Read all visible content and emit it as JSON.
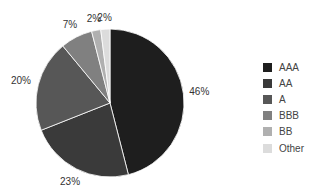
{
  "chart_data": {
    "type": "pie",
    "title": "",
    "categories": [
      "AAA",
      "AA",
      "A",
      "BBB",
      "BB",
      "Other"
    ],
    "values": [
      46,
      23,
      20,
      7,
      2,
      2
    ],
    "labels": [
      "46%",
      "23%",
      "20%",
      "7%",
      "2%",
      "2%"
    ],
    "colors": [
      "#1e1e1e",
      "#3a3a3a",
      "#575757",
      "#808080",
      "#b0b0b0",
      "#dcdcdc"
    ],
    "start_angle": "12 o'clock",
    "direction": "clockwise",
    "legend_position": "right"
  },
  "legend": {
    "items": [
      {
        "label": "AAA",
        "color": "#1e1e1e"
      },
      {
        "label": "AA",
        "color": "#3a3a3a"
      },
      {
        "label": "A",
        "color": "#575757"
      },
      {
        "label": "BBB",
        "color": "#808080"
      },
      {
        "label": "BB",
        "color": "#b0b0b0"
      },
      {
        "label": "Other",
        "color": "#dcdcdc"
      }
    ]
  }
}
